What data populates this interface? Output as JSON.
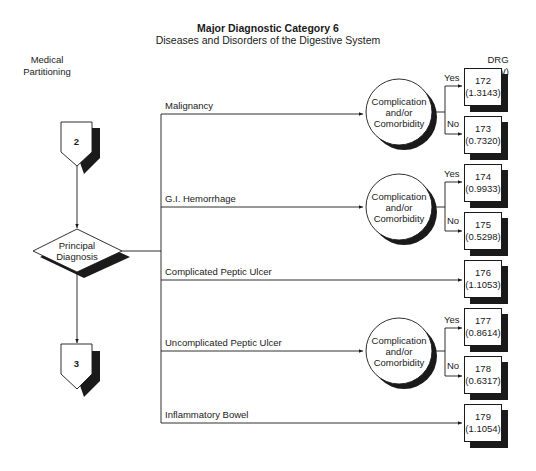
{
  "header": {
    "title": "Major Diagnostic Category 6",
    "subtitle": "Diseases and Disorders of the Digestive System"
  },
  "side_label": [
    "Medical",
    "Partitioning"
  ],
  "drg_header": [
    "DRG",
    "(RW)"
  ],
  "flow": {
    "entry_node": "2",
    "decision_node": [
      "Principal",
      "Diagnosis"
    ],
    "exit_node": "3"
  },
  "cc_node": [
    "Complication",
    "and/or",
    "Comorbidity"
  ],
  "yes_label": "Yes",
  "no_label": "No",
  "branches": [
    {
      "label": "Malignancy",
      "has_cc": true
    },
    {
      "label": "G.I. Hemorrhage",
      "has_cc": true
    },
    {
      "label": "Complicated Peptic Ulcer",
      "has_cc": false
    },
    {
      "label": "Uncomplicated Peptic Ulcer",
      "has_cc": true
    },
    {
      "label": "Inflammatory Bowel",
      "has_cc": false
    }
  ],
  "drgs": [
    {
      "drg": "172",
      "rw": "(1.3143)"
    },
    {
      "drg": "173",
      "rw": "(0.7320)"
    },
    {
      "drg": "174",
      "rw": "(0.9933)"
    },
    {
      "drg": "175",
      "rw": "(0.5298)"
    },
    {
      "drg": "176",
      "rw": "(1.1053)"
    },
    {
      "drg": "177",
      "rw": "(0.8614)"
    },
    {
      "drg": "178",
      "rw": "(0.6317)"
    },
    {
      "drg": "179",
      "rw": "(1.1054)"
    }
  ]
}
